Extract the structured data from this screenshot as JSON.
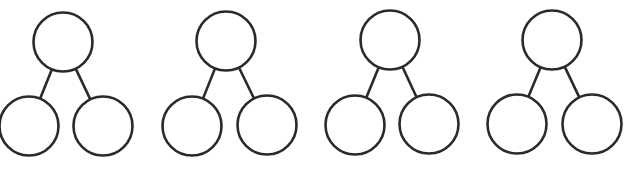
{
  "diagram": {
    "type": "number-bond",
    "stroke_color": "#2a2a2a",
    "stroke_width": 2.6,
    "radius": 29.5,
    "bonds": [
      {
        "top": {
          "cx": 63,
          "cy": 42,
          "label": ""
        },
        "left": {
          "cx": 29,
          "cy": 126,
          "label": ""
        },
        "right": {
          "cx": 103,
          "cy": 126,
          "label": ""
        }
      },
      {
        "top": {
          "cx": 226,
          "cy": 41,
          "label": ""
        },
        "left": {
          "cx": 192,
          "cy": 126,
          "label": ""
        },
        "right": {
          "cx": 267,
          "cy": 125,
          "label": ""
        }
      },
      {
        "top": {
          "cx": 390,
          "cy": 40,
          "label": ""
        },
        "left": {
          "cx": 355,
          "cy": 125,
          "label": ""
        },
        "right": {
          "cx": 429,
          "cy": 124,
          "label": ""
        }
      },
      {
        "top": {
          "cx": 552,
          "cy": 40,
          "label": ""
        },
        "left": {
          "cx": 517,
          "cy": 124,
          "label": ""
        },
        "right": {
          "cx": 592,
          "cy": 124,
          "label": ""
        }
      }
    ]
  }
}
